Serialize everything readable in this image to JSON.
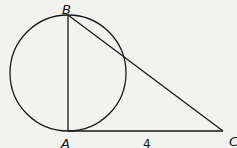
{
  "diagram": {
    "type": "geometry",
    "shapes": {
      "circle": {
        "cx": 68,
        "cy": 73,
        "r": 58
      },
      "segments": [
        {
          "from": "B",
          "to": "A"
        },
        {
          "from": "B",
          "to": "C"
        },
        {
          "from": "A",
          "to": "C"
        }
      ]
    },
    "points": {
      "A": {
        "label": "A",
        "x": 68,
        "y": 131
      },
      "B": {
        "label": "B",
        "x": 68,
        "y": 15
      },
      "C": {
        "label": "C",
        "x": 223,
        "y": 131
      }
    },
    "measurements": {
      "AC": "4"
    },
    "colors": {
      "stroke": "#1a1a1a",
      "background": "#f2f2f0"
    }
  }
}
